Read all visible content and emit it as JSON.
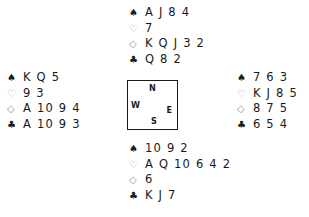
{
  "deal": {
    "north": {
      "spades": "A J 8 4",
      "hearts": "7",
      "diamonds": "K Q J 3 2",
      "clubs": "Q 8 2"
    },
    "west": {
      "spades": "K Q 5",
      "hearts": "9 3",
      "diamonds": "A 10 9 4",
      "clubs": "A 10 9 3"
    },
    "east": {
      "spades": "7 6 3",
      "hearts": "K J 8 5",
      "diamonds": "8 7 5",
      "clubs": "6 5 4"
    },
    "south": {
      "spades": "10 9 2",
      "hearts": "A Q 10 6 4 2",
      "diamonds": "6",
      "clubs": "K J 7"
    }
  },
  "compass": {
    "n": "N",
    "w": "W",
    "e": "E",
    "s": "S"
  },
  "symbols": {
    "spades": "♠",
    "hearts": "♡",
    "diamonds": "◇",
    "clubs": "♣"
  }
}
